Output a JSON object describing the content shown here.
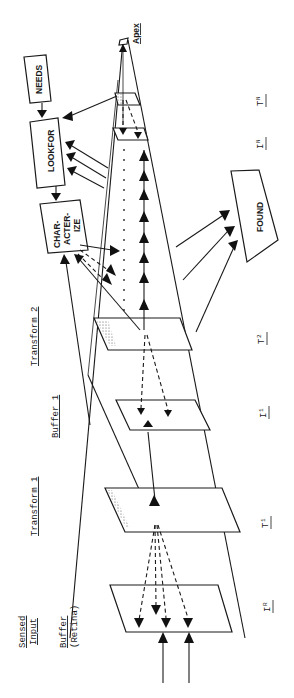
{
  "diagram": {
    "orientation": "rotated 90deg counter-clockwise",
    "header_labels": {
      "sensed_input": [
        "Sensed",
        "Input"
      ],
      "buffer_retina": "Buffer",
      "retina_note": "(Retina)",
      "transform1": "Transform 1",
      "buffer1": "Buffer 1",
      "transform2": "Transform 2",
      "apex": "Apex"
    },
    "boxes": {
      "needs": "NEEDS",
      "lookfor": "LOOKFOR",
      "characterize": [
        "CHAR-",
        "ACTER-",
        "IZE"
      ],
      "found": "FOUND"
    },
    "plane_labels": [
      {
        "main": "I",
        "sub": "R"
      },
      {
        "main": "T",
        "sub": "1"
      },
      {
        "main": "I",
        "sub": "1"
      },
      {
        "main": "T",
        "sub": "2"
      },
      {
        "main": "I",
        "sub": "N"
      },
      {
        "main": "T",
        "sub": "N"
      }
    ],
    "colors": {
      "ink": "#1a1a1a",
      "background": "#ffffff"
    }
  }
}
